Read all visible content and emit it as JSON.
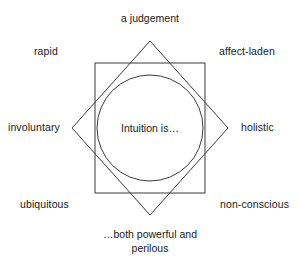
{
  "diagram": {
    "type": "eight-pointed-star-concept-map",
    "core_label": "Intuition is…",
    "shapes": {
      "square": {
        "x": 95,
        "y": 63,
        "width": 110,
        "height": 130
      },
      "diamond": {
        "center_x": 150,
        "center_y": 128,
        "half_diagonal": 87
      },
      "circle": {
        "center_x": 150,
        "center_y": 128,
        "radius": 53
      },
      "stroke_color": "#3a3a3a",
      "fill_color": "none",
      "stroke_width": 1
    },
    "attributes": [
      {
        "id": "a-judgement",
        "label": "a judgement",
        "position": "top"
      },
      {
        "id": "affect-laden",
        "label": "affect-laden",
        "position": "top-right"
      },
      {
        "id": "holistic",
        "label": "holistic",
        "position": "right"
      },
      {
        "id": "non-conscious",
        "label": "non-conscious",
        "position": "bottom-right"
      },
      {
        "id": "powerful-perilous",
        "label": "…both powerful and perilous",
        "position": "bottom"
      },
      {
        "id": "ubiquitous",
        "label": "ubiquitous",
        "position": "bottom-left"
      },
      {
        "id": "involuntary",
        "label": "involuntary",
        "position": "left"
      },
      {
        "id": "rapid",
        "label": "rapid",
        "position": "top-left"
      }
    ],
    "bottom_label_lines": {
      "line1": "…both powerful and",
      "line2": "perilous"
    }
  }
}
